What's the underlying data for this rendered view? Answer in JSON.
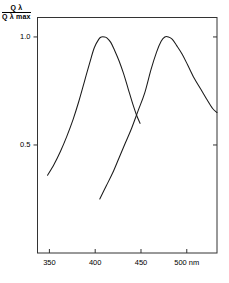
{
  "chart_data": {
    "type": "line",
    "title": "",
    "xlabel": "nm",
    "ylabel": "Q λ / Q λ max",
    "ylabel_numerator": "Q λ",
    "ylabel_denominator": "Q λ max",
    "x_unit": "nm",
    "xlim": [
      337,
      533
    ],
    "ylim": [
      0.0,
      1.09
    ],
    "grid": false,
    "legend": false,
    "x_ticks": [
      350,
      400,
      450,
      500
    ],
    "x_tick_labels": [
      "350",
      "400",
      "450",
      "500"
    ],
    "x_unit_label": "nm",
    "y_ticks": [
      0.5,
      1.0
    ],
    "y_tick_labels": [
      "0.5",
      "1.0"
    ],
    "line_color": "#1a1a1a",
    "axis_color": "#333333",
    "background": "#ffffff",
    "series": [
      {
        "name": "curve-1",
        "peak_x": 410,
        "peak_y": 1.0,
        "x": [
          348,
          355,
          362,
          369,
          376,
          382,
          388,
          394,
          399,
          404,
          407,
          410,
          413,
          417,
          421,
          426,
          431,
          436,
          441,
          445,
          449
        ],
        "values": [
          0.36,
          0.41,
          0.47,
          0.54,
          0.62,
          0.7,
          0.79,
          0.88,
          0.95,
          0.99,
          1.0,
          1.0,
          0.995,
          0.975,
          0.94,
          0.89,
          0.83,
          0.76,
          0.69,
          0.64,
          0.6
        ]
      },
      {
        "name": "curve-2",
        "peak_x": 478,
        "peak_y": 1.0,
        "x": [
          405,
          412,
          419,
          426,
          433,
          440,
          447,
          454,
          461,
          467,
          472,
          476,
          480,
          484,
          489,
          495,
          501,
          508,
          515,
          522,
          528,
          533
        ],
        "values": [
          0.25,
          0.31,
          0.37,
          0.44,
          0.51,
          0.58,
          0.66,
          0.74,
          0.85,
          0.93,
          0.98,
          1.0,
          1.0,
          0.99,
          0.96,
          0.92,
          0.87,
          0.81,
          0.76,
          0.71,
          0.67,
          0.65
        ]
      }
    ]
  }
}
